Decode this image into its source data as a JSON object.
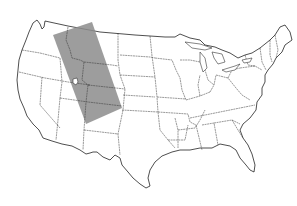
{
  "map": {
    "subject": "Contiguous United States outline map with state borders",
    "highlight": {
      "label": "",
      "shape": "rotated rectangle band",
      "color": "#8c8c8c",
      "corners": [
        [
          53,
          35
        ],
        [
          92,
          22
        ],
        [
          122,
          108
        ],
        [
          86,
          124
        ]
      ]
    },
    "marker": {
      "name": "small lake outline (Great Salt Lake area)",
      "position": [
        75,
        82
      ]
    }
  }
}
